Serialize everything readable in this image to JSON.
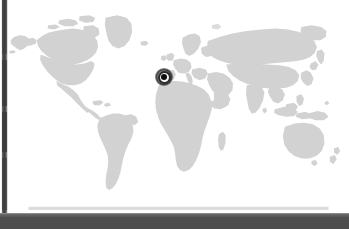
{
  "app": {
    "title": "World Map Location Viewer",
    "view_type": "world-map"
  },
  "map": {
    "projection": "equirectangular",
    "land_color": "#d2d2d2",
    "land_color_light": "#dcdcdc",
    "ocean_color": "#ffffff",
    "background_color": "#ffffff",
    "regions": [
      "North America",
      "Greenland",
      "South America",
      "Europe",
      "Africa",
      "Asia",
      "Australia",
      "Madagascar",
      "Indonesia",
      "New Zealand",
      "Japan",
      "United Kingdom",
      "Iceland"
    ]
  },
  "marker": {
    "label": "Selected location",
    "ring_color": "#2b2b2b",
    "dot_color": "#0d0d0d",
    "halo_color": "#1e1e1e",
    "x_px": 164,
    "y_px": 77,
    "region_hint": "Strait of Gibraltar"
  },
  "chrome": {
    "left_strip_color": "#4a4a4a",
    "bottom_bar_color": "#4d4d4d",
    "bottom_bar_highlight": "#8a8a8a",
    "bottom_bar_label": ""
  }
}
